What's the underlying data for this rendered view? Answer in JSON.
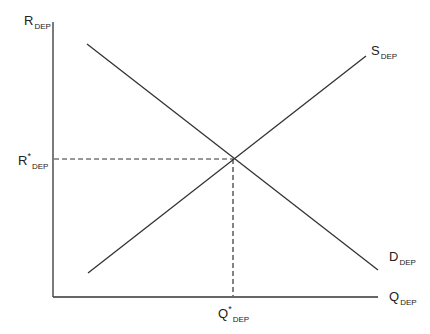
{
  "diagram": {
    "type": "supply-demand",
    "title": "",
    "y_axis": {
      "label": "R",
      "subscript": "DEP"
    },
    "x_axis": {
      "label": "Q",
      "subscript": "DEP"
    },
    "supply": {
      "label": "S",
      "subscript": "DEP"
    },
    "demand": {
      "label": "D",
      "subscript": "DEP"
    },
    "equilibrium_rate": {
      "label": "R",
      "star": "*",
      "subscript": "DEP"
    },
    "equilibrium_quantity": {
      "label": "Q",
      "star": "*",
      "subscript": "DEP"
    },
    "line_color": "#333333"
  }
}
